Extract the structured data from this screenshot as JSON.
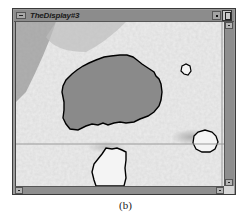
{
  "window": {
    "title": "TheDisplay#3",
    "controls": {
      "system_menu_icon": "dash-icon",
      "minimize_icon": "dot-icon",
      "maximize_icon": "square-icon"
    }
  },
  "viewport": {
    "content": "grayscale image with segmented region outlines",
    "crosshair": {
      "x": 206,
      "y": 122
    },
    "colors": {
      "background": "#f2f2f2",
      "region_fill": "#8a8a8a",
      "outline": "#000000",
      "crosshair": "#9a9a9a"
    }
  },
  "scrollbars": {
    "vertical": {
      "up_arrow": "up-arrow-icon",
      "down_arrow": "down-arrow-icon"
    },
    "horizontal": {
      "left_arrow": "left-arrow-icon",
      "right_arrow": "right-arrow-icon"
    }
  },
  "caption": "(b)"
}
